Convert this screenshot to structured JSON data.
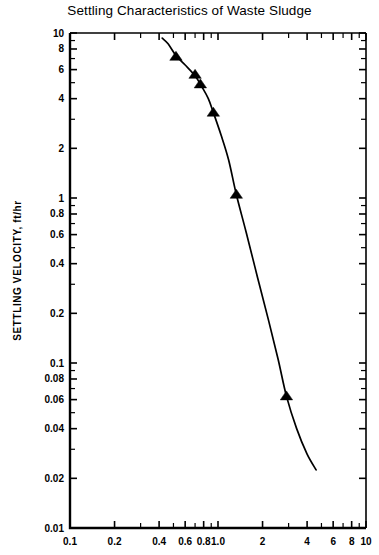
{
  "chart_data": {
    "type": "scatter",
    "title": "Settling Characteristics of Waste Sludge",
    "xlabel": "",
    "ylabel": "SETTLING VELOCITY, ft/hr",
    "xscale": "log",
    "yscale": "log",
    "xlim": [
      0.1,
      10
    ],
    "ylim": [
      0.01,
      10
    ],
    "grid": false,
    "legend": null,
    "marker": "triangle-up",
    "x_tick_labels": [
      "0.1",
      "0.2",
      "0.4",
      "0.6",
      "0.8",
      "1.0",
      "2",
      "4",
      "6",
      "8",
      "10"
    ],
    "x_tick_values": [
      0.1,
      0.2,
      0.4,
      0.6,
      0.8,
      1.0,
      2,
      4,
      6,
      8,
      10
    ],
    "x_minor_ticks": [
      0.3,
      0.5,
      0.7,
      0.9,
      3,
      5,
      7,
      9
    ],
    "y_tick_labels": [
      "10",
      "8",
      "6",
      "4",
      "2",
      "1",
      "0.8",
      "0.6",
      "0.4",
      "0.2",
      "0.1",
      "0.08",
      "0.06",
      "0.04",
      "0.02",
      "0.01"
    ],
    "y_tick_values": [
      10,
      8,
      6,
      4,
      2,
      1,
      0.8,
      0.6,
      0.4,
      0.2,
      0.1,
      0.08,
      0.06,
      0.04,
      0.02,
      0.01
    ],
    "y_minor_ticks": [
      9,
      7,
      5,
      3,
      0.9,
      0.7,
      0.5,
      0.3,
      0.09,
      0.07,
      0.05,
      0.03
    ],
    "points": [
      {
        "x": 0.52,
        "y": 7.2
      },
      {
        "x": 0.7,
        "y": 5.6
      },
      {
        "x": 0.76,
        "y": 4.9
      },
      {
        "x": 0.93,
        "y": 3.3
      },
      {
        "x": 1.33,
        "y": 1.05
      },
      {
        "x": 2.9,
        "y": 0.063
      }
    ],
    "curve": [
      {
        "x": 0.42,
        "y": 9.3
      },
      {
        "x": 0.46,
        "y": 8.6
      },
      {
        "x": 0.52,
        "y": 7.3
      },
      {
        "x": 0.6,
        "y": 6.4
      },
      {
        "x": 0.7,
        "y": 5.5
      },
      {
        "x": 0.78,
        "y": 4.7
      },
      {
        "x": 0.86,
        "y": 4.0
      },
      {
        "x": 0.93,
        "y": 3.3
      },
      {
        "x": 1.05,
        "y": 2.4
      },
      {
        "x": 1.18,
        "y": 1.7
      },
      {
        "x": 1.33,
        "y": 1.05
      },
      {
        "x": 1.55,
        "y": 0.62
      },
      {
        "x": 1.85,
        "y": 0.33
      },
      {
        "x": 2.2,
        "y": 0.18
      },
      {
        "x": 2.55,
        "y": 0.105
      },
      {
        "x": 2.9,
        "y": 0.063
      },
      {
        "x": 3.4,
        "y": 0.04
      },
      {
        "x": 4.0,
        "y": 0.028
      },
      {
        "x": 4.6,
        "y": 0.0225
      }
    ],
    "colors": {
      "axis": "#000000",
      "curve": "#000000",
      "marker": "#000000",
      "background": "#ffffff"
    }
  }
}
